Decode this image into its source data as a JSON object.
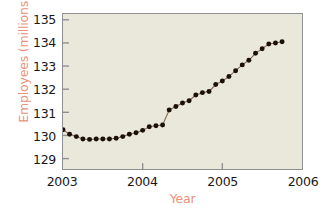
{
  "chart_data": {
    "type": "line",
    "title": "",
    "subtitle": "",
    "xlabel": "Year",
    "ylabel": "Employees (millions)",
    "xlim": [
      2003.0,
      2006.0
    ],
    "ylim": [
      128.55,
      135.25
    ],
    "xticks": [
      2003,
      2004,
      2005,
      2006
    ],
    "xtick_labels": [
      "2003",
      "2004",
      "2005",
      "2006"
    ],
    "yticks": [
      129,
      130,
      131,
      132,
      133,
      134,
      135
    ],
    "ytick_labels": [
      "129",
      "130",
      "131",
      "132",
      "133",
      "134",
      "135"
    ],
    "grid": false,
    "legend": null,
    "marker": "filled-circle",
    "marker_color": "#1a1008",
    "line_color": "#8a6a58",
    "plot_background": "#e9e8da",
    "axis_color": "#8e9092",
    "label_color": "#e8927c",
    "tick_label_color": "#191817",
    "series": [
      {
        "name": "Employees (millions)",
        "x": [
          2003.0,
          2003.083,
          2003.167,
          2003.25,
          2003.333,
          2003.417,
          2003.5,
          2003.583,
          2003.667,
          2003.75,
          2003.833,
          2003.917,
          2004.0,
          2004.083,
          2004.167,
          2004.25,
          2004.333,
          2004.417,
          2004.5,
          2004.583,
          2004.667,
          2004.75,
          2004.833,
          2004.917,
          2005.0,
          2005.083,
          2005.167,
          2005.25,
          2005.333,
          2005.417,
          2005.5,
          2005.583,
          2005.667,
          2005.75
        ],
        "y": [
          130.25,
          130.05,
          129.95,
          129.85,
          129.83,
          129.85,
          129.85,
          129.85,
          129.88,
          129.95,
          130.05,
          130.12,
          130.22,
          130.38,
          130.42,
          130.45,
          131.1,
          131.25,
          131.4,
          131.5,
          131.75,
          131.85,
          131.9,
          132.2,
          132.35,
          132.55,
          132.8,
          133.05,
          133.25,
          133.55,
          133.75,
          133.95,
          134.0,
          134.05
        ]
      }
    ]
  }
}
